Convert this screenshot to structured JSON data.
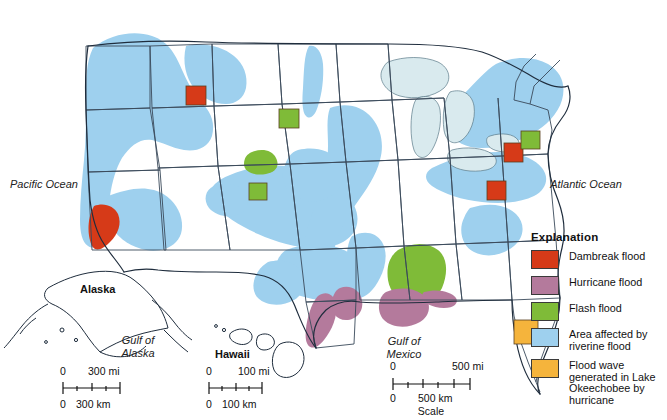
{
  "map": {
    "title": "Flood hazards of the United States",
    "background_color": "#ffffff",
    "ocean_labels": {
      "pacific": "Pacific Ocean",
      "atlantic": "Atlantic Ocean",
      "gulf_of_mexico_line1": "Gulf of",
      "gulf_of_mexico_line2": "Mexico",
      "gulf_of_alaska_line1": "Gulf of",
      "gulf_of_alaska_line2": "Alaska"
    },
    "inset_labels": {
      "alaska": "Alaska",
      "hawaii": "Hawaii"
    },
    "colors": {
      "dambreak": "#d63a18",
      "hurricane": "#b47a9c",
      "flash": "#7fbb38",
      "riverine": "#9ed0ee",
      "okeechobee": "#f5b43c",
      "lakes": "#d9eaee",
      "state_line": "#3a4a5a",
      "coast_line": "#1f2d3d",
      "swatch_border": "#3a3a3a"
    }
  },
  "legend": {
    "title": "Explanation",
    "items": [
      {
        "color": "#d63a18",
        "label": "Dambreak flood",
        "name": "dambreak-flood"
      },
      {
        "color": "#b47a9c",
        "label": "Hurricane flood",
        "name": "hurricane-flood"
      },
      {
        "color": "#7fbb38",
        "label": "Flash flood",
        "name": "flash-flood"
      },
      {
        "color": "#9ed0ee",
        "label": "Area affected by riverine flood",
        "name": "riverine-flood"
      },
      {
        "color": "#f5b43c",
        "label": "Flood wave generated in Lake Okeechobee by hurricane",
        "name": "okeechobee-flood"
      }
    ]
  },
  "scales": {
    "alaska": {
      "mi_zero": "0",
      "mi_max": "300 mi",
      "km_zero": "0",
      "km_max": "300 km"
    },
    "hawaii": {
      "mi_zero": "0",
      "mi_max": "100 mi",
      "km_zero": "0",
      "km_max": "100 km"
    },
    "main": {
      "mi_zero": "0",
      "mi_max": "500 mi",
      "km_zero": "0",
      "km_max": "500 km",
      "caption": "Scale"
    }
  },
  "markers": [
    {
      "name": "dambreak-marker-idaho",
      "type": "Dambreak flood",
      "color": "#d63a18",
      "x": 186,
      "y": 86,
      "w": 20,
      "h": 19
    },
    {
      "name": "dambreak-marker-california",
      "type": "Dambreak flood",
      "color": "#d63a18",
      "x": 86,
      "y": 202,
      "w": 0,
      "h": 0
    },
    {
      "name": "flash-marker-south-dakota",
      "type": "Flash flood",
      "color": "#7fbb38",
      "x": 279,
      "y": 109,
      "w": 20,
      "h": 19
    },
    {
      "name": "flash-marker-colorado",
      "type": "Flash flood",
      "color": "#7fbb38",
      "x": 249,
      "y": 183,
      "w": 18,
      "h": 17
    },
    {
      "name": "dambreak-marker-pennsylvania",
      "type": "Dambreak flood",
      "color": "#d63a18",
      "x": 504,
      "y": 143,
      "w": 19,
      "h": 19
    },
    {
      "name": "dambreak-marker-westvirginia",
      "type": "Dambreak flood",
      "color": "#d63a18",
      "x": 487,
      "y": 181,
      "w": 19,
      "h": 19
    },
    {
      "name": "flash-marker-newjersey",
      "type": "Flash flood",
      "color": "#7fbb38",
      "x": 521,
      "y": 131,
      "w": 19,
      "h": 18
    },
    {
      "name": "okeechobee-marker-florida",
      "type": "Flood wave generated in Lake Okeechobee by hurricane",
      "color": "#f5b43c",
      "x": 514,
      "y": 320,
      "w": 24,
      "h": 24
    }
  ]
}
